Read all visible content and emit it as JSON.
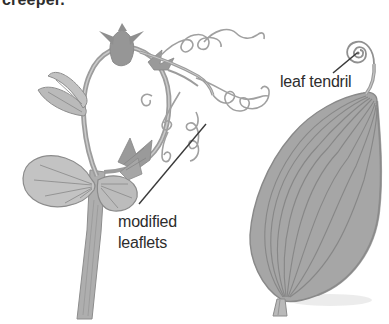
{
  "caption_top": "creeper.",
  "labels": {
    "modified_leaflets": "modified leaflets",
    "leaf_tendril": "leaf tendril"
  },
  "illustrations": {
    "left": "creeper plant stem with coiled thread-like tendrils",
    "right": "leaf whose tip extends into a coiled tendril"
  },
  "colors": {
    "background": "#ffffff",
    "text": "#2d2d2d",
    "pointer_line": "#3a3a3a",
    "ink_outline": "#8a8a8a",
    "stem_gray": "#9c9c9c",
    "leaf_fill": "#a6a6a6",
    "leaf_fill_light": "#c2c2c2"
  }
}
